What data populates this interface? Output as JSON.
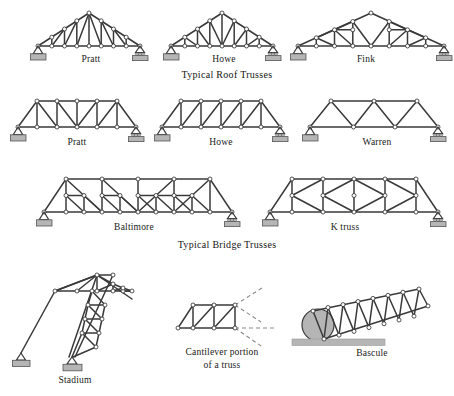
{
  "figure": {
    "background": "#ffffff",
    "member_color": "#3a3a3a",
    "joint_fill": "#ffffff",
    "joint_stroke": "#2b2b2b",
    "support_fill": "#b5b5b5",
    "support_stroke": "#555555",
    "dashed_color": "#8a8a8a",
    "text_color": "#1a1a1a"
  },
  "group_captions": {
    "roof": "Typical Roof Trusses",
    "bridge": "Typical  Bridge Trusses"
  },
  "trusses": [
    {
      "id": "roof-pratt",
      "label": "Pratt",
      "row": "roof",
      "family": "roof",
      "panels": 8,
      "supports": [
        "pin",
        "roller"
      ]
    },
    {
      "id": "roof-howe",
      "label": "Howe",
      "row": "roof",
      "family": "roof",
      "panels": 8,
      "supports": [
        "pin",
        "roller"
      ]
    },
    {
      "id": "roof-fink",
      "label": "Fink",
      "row": "roof",
      "family": "roof",
      "panels": 8,
      "supports": [
        "pin",
        "roller"
      ]
    },
    {
      "id": "bridge-pratt",
      "label": "Pratt",
      "row": "bridge",
      "family": "bridge",
      "panels": 6,
      "supports": [
        "pin",
        "roller"
      ]
    },
    {
      "id": "bridge-howe",
      "label": "Howe",
      "row": "bridge",
      "family": "bridge",
      "panels": 6,
      "supports": [
        "pin",
        "roller"
      ]
    },
    {
      "id": "bridge-warren",
      "label": "Warren",
      "row": "bridge",
      "family": "bridge",
      "panels": 4,
      "supports": [
        "pin",
        "roller"
      ]
    },
    {
      "id": "baltimore",
      "label": "Baltimore",
      "row": "bridge2",
      "family": "bridge",
      "panels": 8,
      "supports": [
        "pin",
        "roller"
      ]
    },
    {
      "id": "ktruss",
      "label": "K truss",
      "row": "bridge2",
      "family": "bridge",
      "panels": 6,
      "supports": [
        "pin",
        "roller"
      ]
    },
    {
      "id": "stadium",
      "label": "Stadium",
      "row": "special",
      "family": "special",
      "panels": 5,
      "supports": [
        "pin",
        "pin"
      ]
    },
    {
      "id": "cantilever",
      "label": "Cantilever portion\nof a truss",
      "label_line1": "Cantilever portion",
      "label_line2": "of a truss",
      "row": "special",
      "family": "special",
      "panels": 3,
      "supports": []
    },
    {
      "id": "bascule",
      "label": "Bascule",
      "row": "special",
      "family": "special",
      "panels": 7,
      "supports": [
        "ground"
      ]
    }
  ],
  "labels": {
    "roof_pratt": "Pratt",
    "roof_howe": "Howe",
    "roof_fink": "Fink",
    "bridge_pratt": "Pratt",
    "bridge_howe": "Howe",
    "bridge_warren": "Warren",
    "baltimore": "Baltimore",
    "ktruss": "K truss",
    "stadium": "Stadium",
    "cantilever_line1": "Cantilever portion",
    "cantilever_line2": "of a truss",
    "bascule": "Bascule"
  }
}
